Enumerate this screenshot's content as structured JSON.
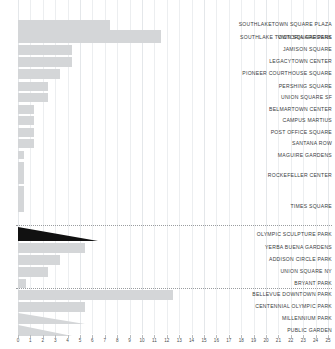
{
  "chart_data": {
    "type": "bar",
    "orientation": "horizontal",
    "title": "",
    "xlabel": "",
    "ylabel": "",
    "xlim": [
      0,
      25
    ],
    "grid": true,
    "legend": null,
    "xticks": [
      0,
      1,
      2,
      3,
      4,
      5,
      6,
      7,
      8,
      9,
      10,
      11,
      12,
      13,
      14,
      15,
      16,
      17,
      18,
      19,
      20,
      21,
      22,
      23,
      24,
      25
    ],
    "colors": {
      "bar": "#d4d6d8",
      "highlight": "#111111",
      "grid": "#eceef0",
      "text": "#3a3d40",
      "separator": "#9a9da0",
      "background": "#ffffff"
    },
    "categories": [
      "SOUTHLAKE TOWN SQUARE PARK",
      "SOUTHLAKETOWN SQUARE PLAZA",
      "VICTORIA GARDENS",
      "JAMISON SQUARE",
      "LEGACYTOWN CENTER",
      "PIONEER COURTHOUSE SQUARE",
      "PERSHING SQUARE",
      "UNION SQUARE SF",
      "BELMARTOWN CENTER",
      "CAMPUS MARTIUS",
      "POST OFFICE SQUARE",
      "SANTANA ROW",
      "MAGUIRE GARDENS",
      "ROCKEFELLER CENTER",
      "TIMES SQUARE",
      "OLYMPIC SCULPTURE PARK",
      "YERBA BUENA GARDENS",
      "ADDISON CIRCLE PARK",
      "UNION SQUARE NY",
      "BRYANT PARK",
      "BELLEVUE DOWNTOWN PARK",
      "CENTENNIAL OLYMPIC PARK",
      "MILLENNIUM PARK",
      "PUBLIC GARDEN"
    ],
    "values": [
      11.5,
      7.4,
      5.4,
      4.3,
      4.3,
      3.4,
      2.4,
      2.4,
      1.3,
      1.3,
      1.3,
      1.3,
      0.2,
      0.2,
      0.2,
      6.5,
      5.4,
      3.4,
      2.4,
      0.4,
      12.5,
      5.4,
      5.4,
      4.3
    ]
  },
  "rows": [
    {
      "label": "SOUTHLAKE TOWN SQUARE PARK",
      "value": 11.5,
      "y": 30,
      "h": 13,
      "w": 143,
      "style": "bar",
      "labelY": 34
    },
    {
      "label": "SOUTHLAKETOWN SQUARE PLAZA",
      "value": 7.4,
      "y": 20,
      "h": 10,
      "w": 92,
      "style": "bar",
      "labelY": 21
    },
    {
      "label": "VICTORIA GARDENS",
      "value": 5.4,
      "y": 32,
      "h": 10,
      "w": 67,
      "style": "bar",
      "labelY": 34
    },
    {
      "label": "JAMISON SQUARE",
      "value": 4.3,
      "y": 45,
      "h": 10,
      "w": 54,
      "style": "bar",
      "labelY": 46
    },
    {
      "label": "LEGACYTOWN CENTER",
      "value": 4.3,
      "y": 57,
      "h": 10,
      "w": 54,
      "style": "bar",
      "labelY": 58
    },
    {
      "label": "PIONEER COURTHOUSE SQUARE",
      "value": 3.4,
      "y": 69,
      "h": 10,
      "w": 42,
      "style": "bar",
      "labelY": 70
    },
    {
      "label": "PERSHING SQUARE",
      "value": 2.4,
      "y": 82,
      "h": 9,
      "w": 30,
      "style": "bar",
      "labelY": 83
    },
    {
      "label": "UNION SQUARE SF",
      "value": 2.4,
      "y": 93,
      "h": 9,
      "w": 30,
      "style": "bar",
      "labelY": 94
    },
    {
      "label": "BELMARTOWN CENTER",
      "value": 1.3,
      "y": 105,
      "h": 9,
      "w": 16,
      "style": "bar",
      "labelY": 106
    },
    {
      "label": "CAMPUS MARTIUS",
      "value": 1.3,
      "y": 116,
      "h": 9,
      "w": 16,
      "style": "bar",
      "labelY": 117
    },
    {
      "label": "POST OFFICE SQUARE",
      "value": 1.3,
      "y": 128,
      "h": 9,
      "w": 16,
      "style": "bar",
      "labelY": 129
    },
    {
      "label": "SANTANA ROW",
      "value": 1.3,
      "y": 139,
      "h": 9,
      "w": 16,
      "style": "bar",
      "labelY": 140
    },
    {
      "label": "MAGUIRE GARDENS",
      "value": 0.2,
      "y": 151,
      "h": 8,
      "w": 6,
      "style": "bar",
      "labelY": 152
    },
    {
      "label": "ROCKEFELLER CENTER",
      "value": 0.2,
      "y": 162,
      "h": 22,
      "w": 6,
      "style": "bar",
      "labelY": 172
    },
    {
      "label": "TIMES SQUARE",
      "value": 0.2,
      "y": 186,
      "h": 26,
      "w": 6,
      "style": "bar",
      "labelY": 203
    },
    {
      "label": "OLYMPIC SCULPTURE PARK",
      "value": 6.5,
      "y": 227,
      "h": 14,
      "w": 80,
      "style": "wedge-dark",
      "labelY": 231
    },
    {
      "label": "YERBA BUENA GARDENS",
      "value": 5.4,
      "y": 243,
      "h": 10,
      "w": 67,
      "style": "bar",
      "labelY": 244
    },
    {
      "label": "ADDISON CIRCLE PARK",
      "value": 3.4,
      "y": 255,
      "h": 10,
      "w": 42,
      "style": "bar",
      "labelY": 256
    },
    {
      "label": "UNION SQUARE NY",
      "value": 2.4,
      "y": 267,
      "h": 10,
      "w": 30,
      "style": "bar",
      "labelY": 268
    },
    {
      "label": "BRYANT PARK",
      "value": 0.4,
      "y": 279,
      "h": 9,
      "w": 8,
      "style": "bar",
      "labelY": 280
    },
    {
      "label": "BELLEVUE DOWNTOWN PARK",
      "value": 12.5,
      "y": 290,
      "h": 10,
      "w": 155,
      "style": "bar",
      "labelY": 291
    },
    {
      "label": "CENTENNIAL OLYMPIC PARK",
      "value": 5.4,
      "y": 302,
      "h": 10,
      "w": 67,
      "style": "bar",
      "labelY": 303
    },
    {
      "label": "MILLENNIUM PARK",
      "value": 5.4,
      "y": 313,
      "h": 11,
      "w": 67,
      "style": "wedge",
      "labelY": 315
    },
    {
      "label": "PUBLIC GARDEN",
      "value": 4.3,
      "y": 325,
      "h": 11,
      "w": 54,
      "style": "wedge",
      "labelY": 327
    }
  ],
  "separators": [
    {
      "y": 225
    },
    {
      "y": 288
    }
  ]
}
